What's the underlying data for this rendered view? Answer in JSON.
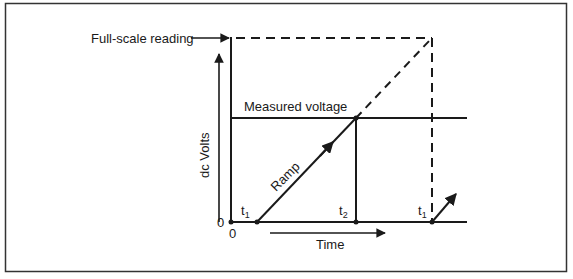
{
  "diagram": {
    "type": "ramp-type digital voltmeter timing diagram",
    "labels": {
      "full_scale": "Full-scale reading",
      "measured_voltage": "Measured voltage",
      "y_axis": "dc Volts",
      "x_axis": "Time",
      "ramp": "Ramp",
      "y_origin": "0",
      "x_origin": "0",
      "t1_main": "t",
      "t1_sub": "1",
      "t2_main": "t",
      "t2_sub": "2",
      "t1b_main": "t",
      "t1b_sub": "1"
    },
    "colors": {
      "line": "#1a1a1a",
      "background": "#ffffff",
      "frame": "#333333"
    }
  }
}
